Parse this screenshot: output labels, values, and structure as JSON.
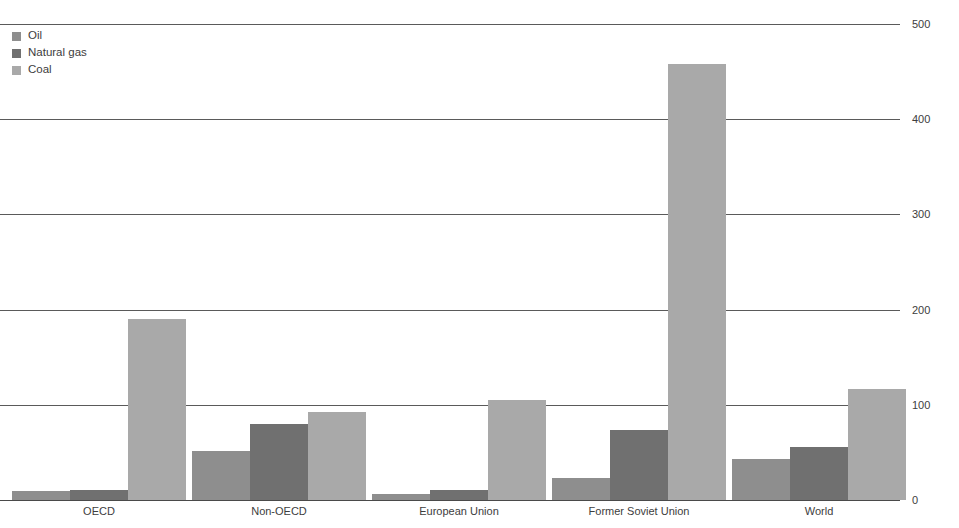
{
  "chart_data": {
    "type": "bar",
    "title": "",
    "subtitle": "",
    "xlabel": "",
    "ylabel": "",
    "ylim": [
      0,
      500
    ],
    "yticks": [
      0,
      100,
      200,
      300,
      400,
      500
    ],
    "grid": true,
    "legend_position": "top-left",
    "categories": [
      "OECD",
      "Non-OECD",
      "European Union",
      "Former Soviet Union",
      "World"
    ],
    "series": [
      {
        "name": "Oil",
        "color": "#8e8e8e",
        "values": [
          9,
          52,
          6,
          23,
          43
        ]
      },
      {
        "name": "Natural gas",
        "color": "#707070",
        "values": [
          11,
          80,
          11,
          74,
          56
        ]
      },
      {
        "name": "Coal",
        "color": "#a9a9a9",
        "values": [
          190,
          92,
          105,
          458,
          117
        ]
      }
    ]
  },
  "legend": {
    "items": [
      {
        "label": "Oil",
        "color": "#8e8e8e"
      },
      {
        "label": "Natural gas",
        "color": "#707070"
      },
      {
        "label": "Coal",
        "color": "#a9a9a9"
      }
    ]
  },
  "axis": {
    "tick_labels": [
      "500",
      "400",
      "300",
      "200",
      "100",
      "0"
    ]
  },
  "colors": {
    "oil": "#8e8e8e",
    "natural_gas": "#707070",
    "coal": "#a9a9a9",
    "gridline": "#5a5a5a",
    "text": "#3d3d3d",
    "background": "#ffffff"
  }
}
